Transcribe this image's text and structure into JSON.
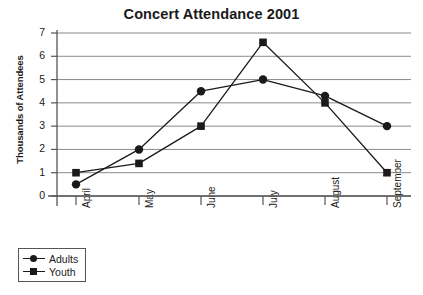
{
  "chart_data": {
    "type": "line",
    "title": "Concert Attendance 2001",
    "xlabel": "",
    "ylabel": "Thousands of Attendees",
    "categories": [
      "April",
      "May",
      "June",
      "July",
      "August",
      "September"
    ],
    "series": [
      {
        "name": "Adults",
        "marker": "circle",
        "values": [
          0.5,
          2.0,
          4.5,
          5.0,
          4.3,
          3.0
        ]
      },
      {
        "name": "Youth",
        "marker": "square",
        "values": [
          1.0,
          1.4,
          3.0,
          6.6,
          4.0,
          1.0
        ]
      }
    ],
    "ylim": [
      0,
      7
    ],
    "yticks": [
      0,
      1,
      2,
      3,
      4,
      5,
      6,
      7
    ],
    "grid": true,
    "grid_axis": "y",
    "legend_position": "below-left",
    "line_color": "#1a1a1a",
    "grid_color": "#8a8a8a",
    "axis_color": "#555555",
    "background": "#ffffff"
  },
  "legend": {
    "entries": [
      {
        "label": "Adults"
      },
      {
        "label": "Youth"
      }
    ]
  }
}
